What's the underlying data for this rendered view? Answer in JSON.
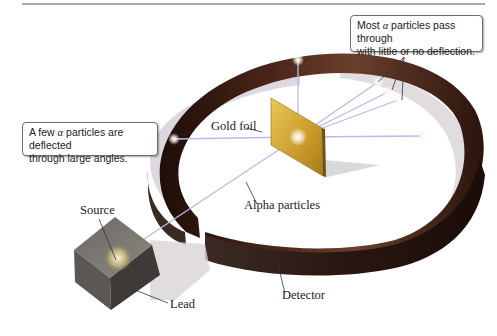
{
  "diagram": {
    "type": "Rutherford gold foil experiment",
    "callouts": {
      "most_pass": {
        "prefix": "Most ",
        "symbol": "α",
        "line1_rest": " particles pass through",
        "line2": "with little or no deflection."
      },
      "few_deflected": {
        "prefix": "A few ",
        "symbol": "α",
        "line1_rest": " particles are deflected",
        "line2": "through large angles."
      }
    },
    "labels": {
      "gold_foil": "Gold foil",
      "alpha_particles": "Alpha particles",
      "source": "Source",
      "lead": "Lead",
      "detector": "Detector"
    },
    "colors": {
      "detector_ring": "#3a1d14",
      "detector_highlight": "#7a4a36",
      "gold_foil": "#d9b23c",
      "lead_block": "#4a4744",
      "beam": "#b9b6e0",
      "rule": "#555555"
    }
  }
}
